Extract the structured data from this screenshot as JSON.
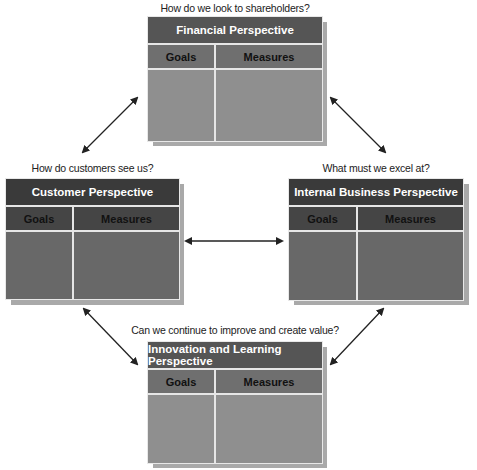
{
  "diagram": {
    "type": "Balanced Scorecard",
    "perspectives": [
      {
        "id": "financial",
        "question": "How do we look to shareholders?",
        "title": "Financial Perspective",
        "columns": [
          "Goals",
          "Measures"
        ]
      },
      {
        "id": "customer",
        "question": "How do customers see us?",
        "title": "Customer Perspective",
        "columns": [
          "Goals",
          "Measures"
        ]
      },
      {
        "id": "internal",
        "question": "What must we excel at?",
        "title": "Internal Business Perspective",
        "columns": [
          "Goals",
          "Measures"
        ]
      },
      {
        "id": "innovation",
        "question": "Can we continue to improve and create value?",
        "title": "Innovation and Learning Perspective",
        "columns": [
          "Goals",
          "Measures"
        ]
      }
    ],
    "connections": [
      {
        "from": "financial",
        "to": "customer",
        "bidirectional": true
      },
      {
        "from": "financial",
        "to": "internal",
        "bidirectional": true
      },
      {
        "from": "customer",
        "to": "internal",
        "bidirectional": true
      },
      {
        "from": "customer",
        "to": "innovation",
        "bidirectional": true
      },
      {
        "from": "internal",
        "to": "innovation",
        "bidirectional": true
      }
    ]
  },
  "colors": {
    "title_band_light": "#555555",
    "header_band_light": "#6f6f6f",
    "body_light": "#8f8f8f",
    "title_band_dark": "#3a3a3a",
    "header_band_dark": "#454545",
    "body_dark": "#686868",
    "shadow": "#a9a9a9",
    "arrow": "#222222"
  }
}
